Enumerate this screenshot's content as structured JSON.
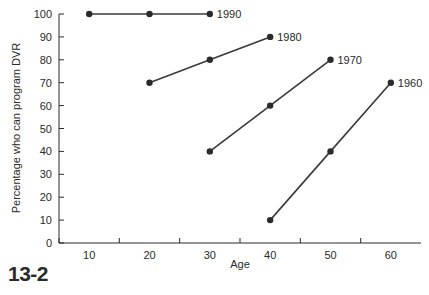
{
  "figure": {
    "caption": "13-2"
  },
  "chart_data": {
    "type": "line",
    "title": "",
    "xlabel": "Age",
    "ylabel": "Percentage who can program DVR",
    "xlim": [
      5,
      65
    ],
    "ylim": [
      0,
      100
    ],
    "xticks": [
      10,
      20,
      30,
      40,
      50,
      60
    ],
    "yticks": [
      0,
      10,
      20,
      30,
      40,
      50,
      60,
      70,
      80,
      90,
      100
    ],
    "grid": false,
    "legend_position": "inline-end-of-line",
    "marker": "filled-circle",
    "line_color": "#3a3a3a",
    "marker_color": "#2b2b2b",
    "series": [
      {
        "name": "1990",
        "x": [
          10,
          20,
          30
        ],
        "values": [
          100,
          100,
          100
        ],
        "label_x": 30,
        "label_y": 100
      },
      {
        "name": "1980",
        "x": [
          20,
          30,
          40
        ],
        "values": [
          70,
          80,
          90
        ],
        "label_x": 40,
        "label_y": 90
      },
      {
        "name": "1970",
        "x": [
          30,
          40,
          50
        ],
        "values": [
          40,
          60,
          80
        ],
        "label_x": 50,
        "label_y": 80
      },
      {
        "name": "1960",
        "x": [
          40,
          50,
          60
        ],
        "values": [
          10,
          40,
          70
        ],
        "label_x": 60,
        "label_y": 70
      }
    ]
  }
}
